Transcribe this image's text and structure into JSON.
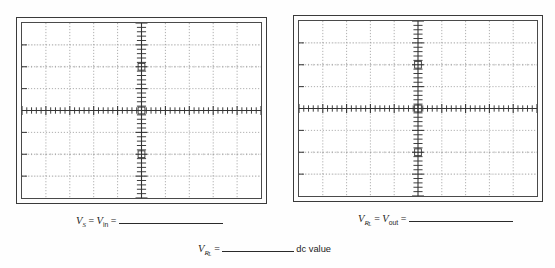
{
  "page": {
    "background_color": "#fefefe",
    "ink_color": "#1c1c1c"
  },
  "scopes": [
    {
      "id": "scope-left",
      "name": "source-voltage-scope",
      "screen": {
        "divisions_x": 10,
        "divisions_y": 8,
        "subdivisions_per_division": 5,
        "grid_style": "dotted",
        "grid_color": "#8c8c8c",
        "axis_color": "#333333",
        "trace": "none",
        "background_color": "#ffffff"
      }
    },
    {
      "id": "scope-right",
      "name": "load-voltage-scope",
      "screen": {
        "divisions_x": 10,
        "divisions_y": 8,
        "subdivisions_per_division": 5,
        "grid_style": "dotted",
        "grid_color": "#8c8c8c",
        "axis_color": "#333333",
        "trace": "none",
        "background_color": "#ffffff"
      }
    }
  ],
  "captions": {
    "left": {
      "symbol1": "V",
      "symbol1_sub": "S",
      "equals1": "=",
      "symbol2": "V",
      "symbol2_sub": "in",
      "equals2": "=",
      "answer_blank": ""
    },
    "right": {
      "symbol1": "V",
      "symbol1_sub": "R",
      "symbol1_sub2": "L",
      "equals1": "=",
      "symbol2": "V",
      "symbol2_sub": "out",
      "equals2": "=",
      "answer_blank": ""
    },
    "bottom": {
      "symbol1": "V",
      "symbol1_sub": "R",
      "symbol1_sub2": "L",
      "equals1": "=",
      "answer_blank": "",
      "trailing_text": "dc value"
    }
  }
}
